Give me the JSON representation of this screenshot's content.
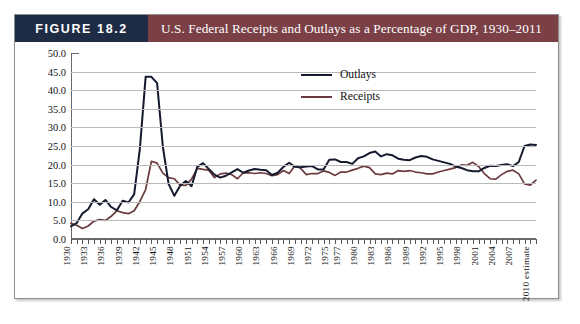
{
  "figure": {
    "badge": "FIGURE 18.2",
    "title": "U.S. Federal Receipts and Outlays as a Percentage of GDP, 1930–2011"
  },
  "legend": {
    "position": "inside-top-right",
    "entries": [
      {
        "label": "Outlays",
        "color": "#151a2e"
      },
      {
        "label": "Receipts",
        "color": "#6b3a3e"
      }
    ]
  },
  "chart_data": {
    "type": "line",
    "title": "U.S. Federal Receipts and Outlays as a Percentage of GDP, 1930–2011",
    "xlabel": "",
    "ylabel": "",
    "ylim": [
      0,
      50
    ],
    "ytick_step": 5,
    "yticks": [
      "0.0",
      "5.0",
      "10.0",
      "15.0",
      "20.0",
      "25.0",
      "30.0",
      "35.0",
      "40.0",
      "45.0",
      "50.0"
    ],
    "grid": true,
    "x": [
      1930,
      1931,
      1932,
      1933,
      1934,
      1935,
      1936,
      1937,
      1938,
      1939,
      1940,
      1941,
      1942,
      1943,
      1944,
      1945,
      1946,
      1947,
      1948,
      1949,
      1950,
      1951,
      1952,
      1953,
      1954,
      1955,
      1956,
      1957,
      1958,
      1959,
      1960,
      1961,
      1962,
      1963,
      1964,
      1965,
      1966,
      1967,
      1968,
      1969,
      1970,
      1971,
      1972,
      1973,
      1974,
      1975,
      1976,
      1977,
      1978,
      1979,
      1980,
      1981,
      1982,
      1983,
      1984,
      1985,
      1986,
      1987,
      1988,
      1989,
      1990,
      1991,
      1992,
      1993,
      1994,
      1995,
      1996,
      1997,
      1998,
      1999,
      2000,
      2001,
      2002,
      2003,
      2004,
      2005,
      2006,
      2007,
      2008,
      2009,
      2010,
      2011
    ],
    "xtick_labels": [
      "1930",
      "1933",
      "1936",
      "1939",
      "1942",
      "1945",
      "1948",
      "1951",
      "1954",
      "1957",
      "1960",
      "1963",
      "1966",
      "1969",
      "1972",
      "1975",
      "1977",
      "1980",
      "1983",
      "1986",
      "1989",
      "1992",
      "1995",
      "1998",
      "2001",
      "2004",
      "2007",
      "2010 estimate"
    ],
    "xtick_years": [
      1930,
      1933,
      1936,
      1939,
      1942,
      1945,
      1948,
      1951,
      1954,
      1957,
      1960,
      1963,
      1966,
      1969,
      1972,
      1975,
      1977,
      1980,
      1983,
      1986,
      1989,
      1992,
      1995,
      1998,
      2001,
      2004,
      2007,
      2010
    ],
    "series": [
      {
        "name": "Outlays",
        "color": "#151a2e",
        "values": [
          3.4,
          4.3,
          6.9,
          8.0,
          10.7,
          9.2,
          10.5,
          8.6,
          7.7,
          10.3,
          9.8,
          12.0,
          24.3,
          43.6,
          43.6,
          41.9,
          24.8,
          14.8,
          11.6,
          14.3,
          15.6,
          14.2,
          19.4,
          20.4,
          18.8,
          17.3,
          16.5,
          17.0,
          17.9,
          18.8,
          17.8,
          18.4,
          18.8,
          18.6,
          18.5,
          17.2,
          17.8,
          19.4,
          20.5,
          19.4,
          19.3,
          19.5,
          19.6,
          18.7,
          18.7,
          21.3,
          21.4,
          20.7,
          20.7,
          20.2,
          21.7,
          22.2,
          23.1,
          23.5,
          22.2,
          22.8,
          22.5,
          21.6,
          21.3,
          21.2,
          21.9,
          22.3,
          22.1,
          21.4,
          21.0,
          20.6,
          20.2,
          19.5,
          19.1,
          18.5,
          18.2,
          18.2,
          19.1,
          19.7,
          19.6,
          19.9,
          20.1,
          19.6,
          20.7,
          25.0,
          25.4,
          25.3
        ]
      },
      {
        "name": "Receipts",
        "color": "#6b3a3e",
        "values": [
          4.2,
          3.7,
          2.8,
          3.5,
          4.8,
          5.2,
          5.0,
          6.1,
          7.6,
          7.1,
          6.8,
          7.6,
          10.1,
          13.3,
          20.9,
          20.4,
          17.7,
          16.5,
          16.2,
          14.5,
          14.4,
          16.1,
          19.0,
          18.7,
          18.5,
          16.5,
          17.5,
          17.7,
          17.3,
          16.2,
          17.8,
          17.8,
          17.6,
          17.8,
          17.6,
          17.0,
          17.3,
          18.4,
          17.6,
          19.7,
          19.0,
          17.3,
          17.6,
          17.6,
          18.3,
          17.9,
          17.1,
          18.0,
          18.0,
          18.5,
          19.0,
          19.6,
          19.2,
          17.5,
          17.3,
          17.7,
          17.5,
          18.4,
          18.2,
          18.4,
          18.0,
          17.8,
          17.5,
          17.5,
          18.0,
          18.4,
          18.8,
          19.2,
          19.9,
          19.8,
          20.6,
          19.5,
          17.6,
          16.2,
          16.1,
          17.3,
          18.2,
          18.5,
          17.5,
          14.8,
          14.5,
          15.8
        ]
      }
    ]
  }
}
